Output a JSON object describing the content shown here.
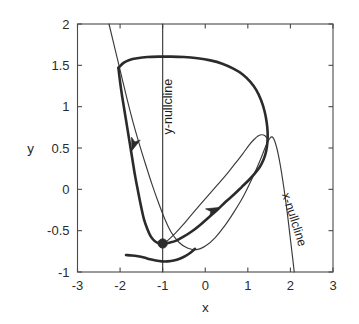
{
  "figure": {
    "background_color": "#ffffff",
    "line_color": "#2b2b2b",
    "axis_color": "#4a4a4a"
  },
  "chart_data": {
    "type": "line",
    "title": "",
    "subtitle": "",
    "xlabel": "x",
    "ylabel": "y",
    "xlim": [
      -3,
      3
    ],
    "ylim": [
      -1,
      2
    ],
    "xticks": [
      -3,
      -2,
      -1,
      0,
      1,
      2,
      3
    ],
    "xticklabels": [
      "-3",
      "-2",
      "-1",
      "0",
      "1",
      "2",
      "3"
    ],
    "yticks": [
      -1,
      -0.5,
      0,
      0.5,
      1,
      1.5,
      2
    ],
    "yticklabels": [
      "-1",
      "-0.5",
      "0",
      "0.5",
      "1",
      "1.5",
      "2"
    ],
    "grid": false,
    "legend": null,
    "legend_position": "none",
    "annotations": [
      {
        "name": "y-nullcline-label",
        "text": "y-nullcline",
        "x": -0.78,
        "y": 1.0,
        "rotation": -90
      },
      {
        "name": "x-nullcline-label",
        "text": "x-nullcline",
        "x": 2.0,
        "y": -0.38,
        "rotation": 72
      }
    ],
    "markers": [
      {
        "name": "equilibrium-point",
        "label": "",
        "x": -1.0,
        "y": -0.655,
        "style": "filled-circle",
        "radius_px": 4.6
      }
    ],
    "series": [
      {
        "name": "y-nullcline",
        "style": "thin-line",
        "description": "vertical line at x = -1",
        "points": [
          [
            -1.0,
            2.0
          ],
          [
            -1.0,
            -1.0
          ]
        ]
      },
      {
        "name": "x-nullcline",
        "style": "thin-line",
        "description": "cubic-like decreasing curve from upper-left to lower-right",
        "points": [
          [
            -2.26,
            2.0
          ],
          [
            -2.12,
            1.7
          ],
          [
            -1.98,
            1.4
          ],
          [
            -1.84,
            1.1
          ],
          [
            -1.7,
            0.82
          ],
          [
            -1.55,
            0.55
          ],
          [
            -1.4,
            0.3
          ],
          [
            -1.25,
            0.06
          ],
          [
            -1.1,
            -0.16
          ],
          [
            -0.95,
            -0.36
          ],
          [
            -0.8,
            -0.52
          ],
          [
            -0.62,
            -0.64
          ],
          [
            -0.42,
            -0.71
          ],
          [
            -0.2,
            -0.73
          ],
          [
            0.02,
            -0.68
          ],
          [
            0.24,
            -0.58
          ],
          [
            0.46,
            -0.44
          ],
          [
            0.68,
            -0.27
          ],
          [
            0.9,
            -0.08
          ],
          [
            1.1,
            0.13
          ],
          [
            1.28,
            0.34
          ],
          [
            1.42,
            0.52
          ],
          [
            1.52,
            0.62
          ],
          [
            1.6,
            0.62
          ],
          [
            1.68,
            0.5
          ],
          [
            1.76,
            0.3
          ],
          [
            1.84,
            0.04
          ],
          [
            1.92,
            -0.26
          ],
          [
            1.99,
            -0.56
          ],
          [
            2.05,
            -0.82
          ],
          [
            2.09,
            -1.0
          ]
        ]
      },
      {
        "name": "trajectory-upper-branch",
        "style": "thick-line",
        "description": "main trajectory: enters upper-left, arcs across top, descends right side, loops back left to equilibrium",
        "points": [
          [
            -2.04,
            1.47
          ],
          [
            -1.92,
            1.53
          ],
          [
            -1.78,
            1.565
          ],
          [
            -1.6,
            1.585
          ],
          [
            -1.36,
            1.6
          ],
          [
            -1.1,
            1.605
          ],
          [
            -0.82,
            1.605
          ],
          [
            -0.5,
            1.6
          ],
          [
            -0.18,
            1.585
          ],
          [
            0.12,
            1.56
          ],
          [
            0.4,
            1.52
          ],
          [
            0.66,
            1.46
          ],
          [
            0.88,
            1.39
          ],
          [
            1.06,
            1.3
          ],
          [
            1.2,
            1.2
          ],
          [
            1.31,
            1.08
          ],
          [
            1.39,
            0.95
          ],
          [
            1.44,
            0.82
          ],
          [
            1.465,
            0.69
          ],
          [
            1.46,
            0.57
          ],
          [
            1.43,
            0.46
          ],
          [
            1.37,
            0.36
          ],
          [
            1.28,
            0.27
          ],
          [
            1.16,
            0.19
          ],
          [
            1.02,
            0.11
          ],
          [
            0.86,
            0.03
          ],
          [
            0.68,
            -0.06
          ],
          [
            0.48,
            -0.15
          ],
          [
            0.28,
            -0.25
          ],
          [
            0.08,
            -0.34
          ],
          [
            -0.12,
            -0.43
          ],
          [
            -0.32,
            -0.51
          ],
          [
            -0.5,
            -0.57
          ],
          [
            -0.68,
            -0.62
          ],
          [
            -0.84,
            -0.645
          ],
          [
            -0.96,
            -0.655
          ]
        ]
      },
      {
        "name": "trajectory-left-descent",
        "style": "thick-line",
        "description": "left descending branch from top arc down past the turning point toward equilibrium",
        "points": [
          [
            -2.04,
            1.47
          ],
          [
            -2.0,
            1.3
          ],
          [
            -1.95,
            1.12
          ],
          [
            -1.89,
            0.93
          ],
          [
            -1.83,
            0.74
          ],
          [
            -1.77,
            0.55
          ],
          [
            -1.71,
            0.36
          ],
          [
            -1.65,
            0.17
          ],
          [
            -1.58,
            -0.02
          ],
          [
            -1.51,
            -0.2
          ],
          [
            -1.44,
            -0.36
          ],
          [
            -1.36,
            -0.48
          ],
          [
            -1.28,
            -0.57
          ],
          [
            -1.2,
            -0.62
          ],
          [
            -1.11,
            -0.65
          ],
          [
            -1.02,
            -0.656
          ]
        ]
      },
      {
        "name": "trajectory-lower-segment",
        "style": "thick-line",
        "description": "shallow lower branch sweeping from left edge under the equilibrium and up to the right",
        "points": [
          [
            -1.86,
            -0.795
          ],
          [
            -1.72,
            -0.8
          ],
          [
            -1.58,
            -0.81
          ],
          [
            -1.44,
            -0.825
          ],
          [
            -1.3,
            -0.845
          ],
          [
            -1.16,
            -0.862
          ],
          [
            -1.02,
            -0.872
          ],
          [
            -0.88,
            -0.872
          ],
          [
            -0.74,
            -0.862
          ],
          [
            -0.6,
            -0.84
          ],
          [
            -0.46,
            -0.805
          ],
          [
            -0.34,
            -0.765
          ],
          [
            -0.24,
            -0.72
          ]
        ]
      },
      {
        "name": "trajectory-inner-return",
        "style": "thin-line",
        "description": "inner thin loop returning from the right lobe back toward the equilibrium region",
        "points": [
          [
            -0.96,
            -0.655
          ],
          [
            -0.84,
            -0.6
          ],
          [
            -0.7,
            -0.53
          ],
          [
            -0.54,
            -0.44
          ],
          [
            -0.36,
            -0.33
          ],
          [
            -0.16,
            -0.21
          ],
          [
            0.06,
            -0.08
          ],
          [
            0.28,
            0.05
          ],
          [
            0.5,
            0.18
          ],
          [
            0.7,
            0.31
          ],
          [
            0.88,
            0.43
          ],
          [
            1.02,
            0.53
          ],
          [
            1.14,
            0.6
          ],
          [
            1.24,
            0.645
          ],
          [
            1.33,
            0.66
          ],
          [
            1.41,
            0.645
          ],
          [
            1.47,
            0.6
          ]
        ]
      }
    ],
    "arrows": [
      {
        "name": "arrow-descending-left",
        "x": -1.72,
        "y": 0.47,
        "angle_deg": 252,
        "description": "downward arrow on left descending branch"
      },
      {
        "name": "arrow-ascending-right",
        "x": 0.32,
        "y": -0.22,
        "angle_deg": 26,
        "description": "up-right arrow on lower rising branch"
      }
    ]
  },
  "watermark": {
    "lines": [
      "",
      ""
    ]
  }
}
